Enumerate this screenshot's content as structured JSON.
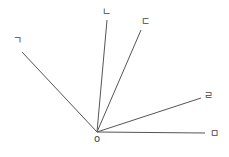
{
  "diagram": {
    "type": "angle-rays",
    "line_color": "#555555",
    "origin": {
      "label": "o",
      "x": 97,
      "y": 132,
      "label_x": 97,
      "label_y": 142
    },
    "rays": [
      {
        "label": "ㄱ",
        "x2": 22,
        "y2": 52,
        "label_x": 17,
        "label_y": 44
      },
      {
        "label": "ㄴ",
        "x2": 107,
        "y2": 20,
        "label_x": 106,
        "label_y": 15
      },
      {
        "label": "ㄷ",
        "x2": 141,
        "y2": 30,
        "label_x": 145,
        "label_y": 25
      },
      {
        "label": "ㄹ",
        "x2": 201,
        "y2": 98,
        "label_x": 208,
        "label_y": 99
      },
      {
        "label": "ㅁ",
        "x2": 205,
        "y2": 133,
        "label_x": 214,
        "label_y": 137
      }
    ]
  }
}
